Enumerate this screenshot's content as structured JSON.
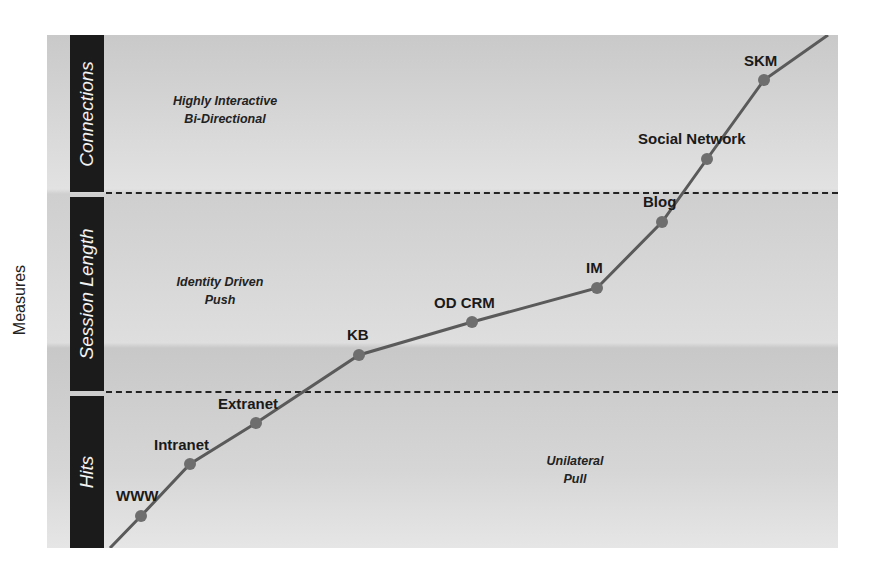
{
  "y_axis_title": "Measures",
  "bands": [
    {
      "label": "Connections",
      "description_line1": "Highly Interactive",
      "description_line2": "Bi-Directional"
    },
    {
      "label": "Session Length",
      "description_line1": "Identity Driven",
      "description_line2": "Push"
    },
    {
      "label": "Hits",
      "description_line1": "Unilateral",
      "description_line2": "Pull"
    }
  ],
  "points": [
    {
      "label": "WWW",
      "x": 141,
      "y": 516
    },
    {
      "label": "Intranet",
      "x": 190,
      "y": 464
    },
    {
      "label": "Extranet",
      "x": 256,
      "y": 423
    },
    {
      "label": "KB",
      "x": 359,
      "y": 355
    },
    {
      "label": "OD CRM",
      "x": 472,
      "y": 322
    },
    {
      "label": "IM",
      "x": 597,
      "y": 288
    },
    {
      "label": "Blog",
      "x": 662,
      "y": 222
    },
    {
      "label": "Social Network",
      "x": 707,
      "y": 159
    },
    {
      "label": "SKM",
      "x": 764,
      "y": 80
    }
  ],
  "line_start": {
    "x": 110,
    "y": 548
  },
  "line_end": {
    "x": 828,
    "y": 35
  },
  "colors": {
    "line": "#5a5a5a",
    "marker": "#6e6e6e",
    "bar": "#1b1b1b"
  }
}
